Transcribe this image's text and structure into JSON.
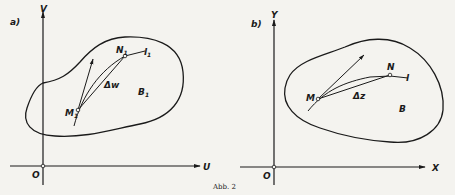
{
  "figure": {
    "caption": "Abb. 2",
    "panels": [
      {
        "id": "a",
        "tag": "a)",
        "axes": {
          "x": "U",
          "y": "V",
          "origin": "O"
        },
        "region": "B",
        "region_sub": "1",
        "curve": "l",
        "curve_sub": "1",
        "point_start": "M",
        "point_start_sub": "1",
        "point_end": "N",
        "point_end_sub": "1",
        "increment": "Δw"
      },
      {
        "id": "b",
        "tag": "b)",
        "axes": {
          "x": "X",
          "y": "Y",
          "origin": "O"
        },
        "region": "B",
        "curve": "l",
        "point_start": "M",
        "point_end": "N",
        "increment": "Δz"
      }
    ],
    "colors": {
      "ink": "#1a1a1a",
      "paper": "#f4f3ef"
    }
  }
}
